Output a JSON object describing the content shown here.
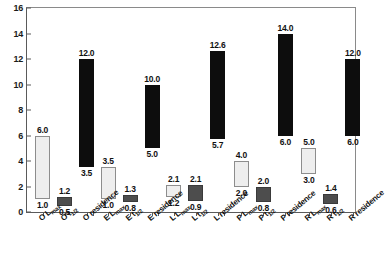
{
  "chart_data": {
    "type": "bar",
    "title": "",
    "xlabel": "",
    "ylabel": "",
    "ylim": [
      0,
      16
    ],
    "yticks": [
      0,
      2,
      4,
      6,
      8,
      10,
      12,
      14,
      16
    ],
    "ytick_labels": [
      "0",
      "2",
      "4",
      "6",
      "8",
      "10",
      "12",
      "14",
      "16"
    ],
    "grid": false,
    "legend": "none",
    "note": "Floating (range) bars: each bar spans from a low value to a high value; labels printed above and below each bar.",
    "categories": [
      "O Lmax",
      "O t1/2",
      "O residence",
      "E Lmax",
      "E t1/2",
      "E residence",
      "L Lmax",
      "L t1/2",
      "L residence",
      "P Lmax",
      "P t1/2",
      "P residence",
      "R Lmax",
      "R t1/2",
      "R residence"
    ],
    "bars": [
      {
        "label_main": "O",
        "label_sub": "Lmax",
        "style": "light",
        "low": 1.0,
        "high": 6.0,
        "low_label": "1.0",
        "high_label": "6.0"
      },
      {
        "label_main": "O",
        "label_sub": "t1/2",
        "style": "dark",
        "low": 0.5,
        "high": 1.2,
        "low_label": "0.5",
        "high_label": "1.2"
      },
      {
        "label_main": "O",
        "label_sub": "residence",
        "style": "black",
        "low": 3.5,
        "high": 12.0,
        "low_label": "3.5",
        "high_label": "12.0"
      },
      {
        "label_main": "E",
        "label_sub": "Lmax",
        "style": "light",
        "low": 1.0,
        "high": 3.5,
        "low_label": "1.0",
        "high_label": "3.5"
      },
      {
        "label_main": "E",
        "label_sub": "t1/2",
        "style": "dark",
        "low": 0.8,
        "high": 1.3,
        "low_label": "0.8",
        "high_label": "1.3"
      },
      {
        "label_main": "E",
        "label_sub": "residence",
        "style": "black",
        "low": 5.0,
        "high": 10.0,
        "low_label": "5.0",
        "high_label": "10.0"
      },
      {
        "label_main": "L",
        "label_sub": "Lmax",
        "style": "light",
        "low": 1.2,
        "high": 2.1,
        "low_label": "1.2",
        "high_label": "2.1"
      },
      {
        "label_main": "L",
        "label_sub": "t1/2",
        "style": "dark",
        "low": 0.9,
        "high": 2.1,
        "low_label": "0.9",
        "high_label": "2.1"
      },
      {
        "label_main": "L",
        "label_sub": "residence",
        "style": "black",
        "low": 5.7,
        "high": 12.6,
        "low_label": "5.7",
        "high_label": "12.6"
      },
      {
        "label_main": "P",
        "label_sub": "Lmax",
        "style": "light",
        "low": 2.0,
        "high": 4.0,
        "low_label": "2.0",
        "high_label": "4.0"
      },
      {
        "label_main": "P",
        "label_sub": "t1/2",
        "style": "dark",
        "low": 0.8,
        "high": 2.0,
        "low_label": "0.8",
        "high_label": "2.0"
      },
      {
        "label_main": "P",
        "label_sub": "residence",
        "style": "black",
        "low": 6.0,
        "high": 14.0,
        "low_label": "6.0",
        "high_label": "14.0"
      },
      {
        "label_main": "R",
        "label_sub": "Lmax",
        "style": "light",
        "low": 3.0,
        "high": 5.0,
        "low_label": "3.0",
        "high_label": "5.0"
      },
      {
        "label_main": "R",
        "label_sub": "t1/2",
        "style": "dark",
        "low": 0.6,
        "high": 1.4,
        "low_label": "0.6",
        "high_label": "1.4"
      },
      {
        "label_main": "R",
        "label_sub": "residence",
        "style": "black",
        "low": 6.0,
        "high": 12.0,
        "low_label": "6.0",
        "high_label": "12.0"
      }
    ],
    "colors": {
      "light_bar": "#eeeeee",
      "light_bar_edge": "#8d8d8d",
      "dark_bar": "#4d4d4d",
      "black_bar": "#0d0d0d",
      "axis": "#5a5a5a",
      "text": "#111111",
      "background": "#ffffff"
    }
  }
}
